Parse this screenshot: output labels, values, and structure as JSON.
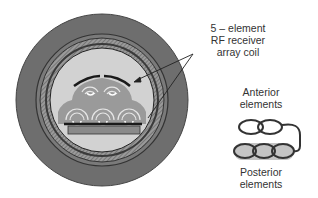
{
  "diagram": {
    "coil_label": [
      "5 – element",
      "RF receiver",
      "array coil"
    ],
    "anterior_label": [
      "Anterior",
      "elements"
    ],
    "posterior_label": [
      "Posterior",
      "elements"
    ],
    "colors": {
      "outer_ring": "#6e6e6e",
      "hatched_ring": "#8a8a8a",
      "bore_interior": "#d2d2d2",
      "subject": "#9a9a9a",
      "coil_element": "#1a1a1a",
      "posterior_fill": "#c4c4c4"
    }
  }
}
